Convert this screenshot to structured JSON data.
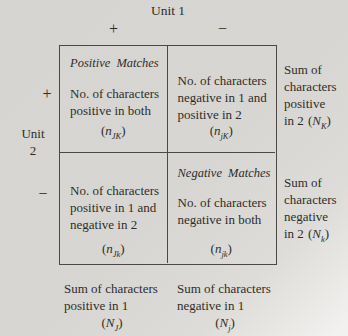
{
  "title": "Unit 1",
  "symbols": {
    "open": "(",
    "close": ")",
    "plus": "+",
    "minus": "−"
  },
  "left_axis": {
    "label_line1": "Unit",
    "label_line2": "2"
  },
  "cells": {
    "pos_match": {
      "title": "Positive Matches",
      "line1": "No. of characters",
      "line2": "positive in both",
      "var": "n",
      "sub": "JK"
    },
    "neg1_pos2": {
      "line1": "No. of characters",
      "line2": "negative in 1 and",
      "line3": "positive in 2",
      "var": "n",
      "sub": "jK"
    },
    "pos1_neg2": {
      "line1": "No. of characters",
      "line2": "positive in 1 and",
      "line3": "negative in 2",
      "var": "n",
      "sub": "Jk"
    },
    "neg_match": {
      "title": "Negative Matches",
      "line1": "No. of characters",
      "line2": "negative in both",
      "var": "n",
      "sub": "jk"
    }
  },
  "margins": {
    "right_top": {
      "line1": "Sum of",
      "line2": "characters",
      "line3": "positive",
      "line4_prefix": "in 2",
      "var": "N",
      "sub": "K"
    },
    "right_bottom": {
      "line1": "Sum of",
      "line2": "characters",
      "line3": "negative",
      "line4_prefix": "in 2",
      "var": "N",
      "sub": "k"
    },
    "bottom_left": {
      "line1": "Sum of characters",
      "line2": "positive in 1",
      "var": "N",
      "sub": "J"
    },
    "bottom_right": {
      "line1": "Sum of characters",
      "line2": "negative in 1",
      "var": "N",
      "sub": "j"
    }
  },
  "colors": {
    "paper": "#d7d6d3",
    "ink": "#2f2d28",
    "line": "#4c4843"
  }
}
